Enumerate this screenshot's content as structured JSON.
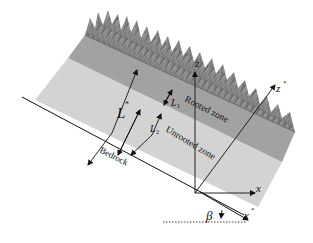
{
  "diagram": {
    "layers": [
      {
        "name": "Rooted zone",
        "color": "#9a9a9a"
      },
      {
        "name": "Unrooted zone",
        "color": "#d0d0d0"
      }
    ],
    "vegetation_color": "#7d7d7d",
    "labels": {
      "total_depth": "L",
      "total_depth_sup": "*",
      "rooted_depth": "L",
      "rooted_depth_sub": "1",
      "rooted_depth_sup": "*",
      "unrooted_depth": "L",
      "unrooted_depth_sub": "2",
      "unrooted_depth_sup": "*",
      "rooted_zone": "Rooted zone",
      "unrooted_zone": "Unrooted zone",
      "bedrock": "Bedrock",
      "axis_z": "z",
      "axis_x": "x",
      "axis_z_star": "z",
      "axis_x_star": "x",
      "star": "*",
      "angle": "β"
    }
  }
}
